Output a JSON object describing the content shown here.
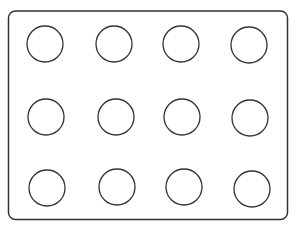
{
  "diagram": {
    "frame": {
      "x": 8.5,
      "y": 11,
      "width": 279,
      "height": 208.5,
      "radius": 7,
      "stroke": "#333333",
      "stroke_width": 1.5
    },
    "circle_style": {
      "r": 18,
      "stroke": "#333333",
      "stroke_width": 1.3,
      "fill": "#ffffff"
    },
    "circles": [
      {
        "row": 1,
        "col": 1,
        "cx": 45,
        "cy": 44
      },
      {
        "row": 1,
        "col": 2,
        "cx": 114,
        "cy": 44
      },
      {
        "row": 1,
        "col": 3,
        "cx": 181,
        "cy": 44
      },
      {
        "row": 1,
        "col": 4,
        "cx": 249,
        "cy": 45
      },
      {
        "row": 2,
        "col": 1,
        "cx": 46,
        "cy": 117
      },
      {
        "row": 2,
        "col": 2,
        "cx": 116,
        "cy": 117
      },
      {
        "row": 2,
        "col": 3,
        "cx": 182,
        "cy": 117
      },
      {
        "row": 2,
        "col": 4,
        "cx": 250,
        "cy": 118
      },
      {
        "row": 3,
        "col": 1,
        "cx": 47,
        "cy": 188
      },
      {
        "row": 3,
        "col": 2,
        "cx": 117,
        "cy": 187
      },
      {
        "row": 3,
        "col": 3,
        "cx": 184,
        "cy": 187
      },
      {
        "row": 3,
        "col": 4,
        "cx": 252,
        "cy": 189
      }
    ]
  }
}
